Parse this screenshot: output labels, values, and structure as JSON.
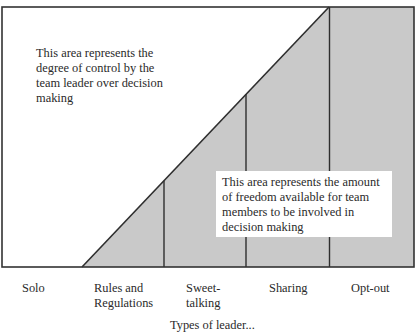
{
  "diagram": {
    "type": "leadership-continuum",
    "colors": {
      "frame": "#333333",
      "team_area_fill": "#c9c9c9",
      "leader_area_fill": "#ffffff",
      "text": "#2a2a2a"
    },
    "notes": {
      "leader_control": "This area represents the degree of control by the team leader over decision making",
      "team_freedom": "This area represents the amount of freedom available for team members to be involved in decision making"
    },
    "notes_lines": {
      "leader_control": [
        "This area represents the",
        "degree of control by the",
        "team leader over decision",
        "making"
      ],
      "team_freedom": [
        "This area represents the amount",
        "of freedom available for team",
        "members to be involved in",
        "decision making"
      ]
    },
    "styles": [
      {
        "label": "Solo",
        "lines": [
          "Solo"
        ]
      },
      {
        "label": "Rules and Regulations",
        "lines": [
          "Rules and",
          "Regulations"
        ]
      },
      {
        "label": "Sweet-talking",
        "lines": [
          "Sweet-",
          "talking"
        ]
      },
      {
        "label": "Sharing",
        "lines": [
          "Sharing"
        ]
      },
      {
        "label": "Opt-out",
        "lines": [
          "Opt-out"
        ]
      }
    ],
    "axis_caption_partial": "Types of leader..."
  }
}
